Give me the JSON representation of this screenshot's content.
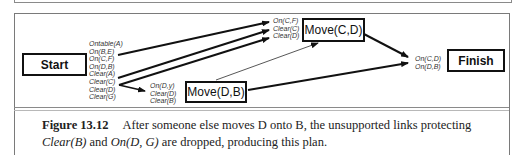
{
  "figure": {
    "nodes": {
      "start": "Start",
      "move_cd": "Move(C,D)",
      "move_db": "Move(D,B)",
      "finish": "Finish"
    },
    "start_effects": [
      "Ontable(A)",
      "On(B,E)",
      "On(C,F)",
      "On(D,B)",
      "Clear(A)",
      "Clear(C)",
      "Clear(D)",
      "Clear(G)"
    ],
    "move_cd_preconditions": [
      "On(C,F)",
      "Clear(C)",
      "Clear(D)"
    ],
    "move_db_preconditions": [
      "On(D,y)",
      "Clear(D)",
      "Clear(B)"
    ],
    "finish_preconditions": [
      "On(C,D)",
      "On(D,B)"
    ]
  },
  "caption": {
    "label": "Figure 13.12",
    "text_1": "After someone else moves D onto B, the unsupported links protecting ",
    "term_1": "Clear(B)",
    "text_2": " and ",
    "term_2": "On(D, G)",
    "text_3": " are dropped, producing this plan."
  }
}
